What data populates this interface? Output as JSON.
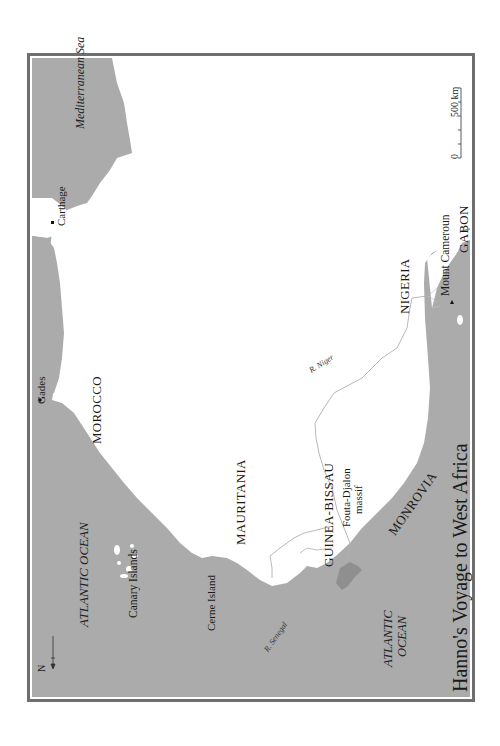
{
  "title": "Hanno's Voyage to West Africa",
  "north_arrow": {
    "label": "N"
  },
  "scale_bar": {
    "start": "0",
    "end": "500 km"
  },
  "regions": {
    "morocco": "MOROCCO",
    "mauritania": "MAURITANIA",
    "guinea_bissau": "GUINEA-BISSAU",
    "monrovia": "MONROVIA",
    "nigeria": "NIGERIA",
    "gabon": "GABON"
  },
  "water": {
    "mediterranean": "Mediterranean Sea",
    "atlantic_north": "ATLANTIC OCEAN",
    "atlantic_south_line1": "ATLANTIC",
    "atlantic_south_line2": "OCEAN"
  },
  "places": {
    "carthage": "Carthage",
    "gades": "Gades",
    "canary_islands": "Canary Islands",
    "cerne_island": "Cerne Island",
    "fouta_djalon_line1": "Fouta-Djalon",
    "fouta_djalon_line2": "massif",
    "mount_cameroun": "Mount Cameroun"
  },
  "rivers": {
    "senegal": "R. Senegal",
    "niger": "R. Niger"
  },
  "colors": {
    "sea": "#ababab",
    "land": "#ffffff",
    "frame": "#6f6f6f",
    "river": "#b5b5b5"
  }
}
